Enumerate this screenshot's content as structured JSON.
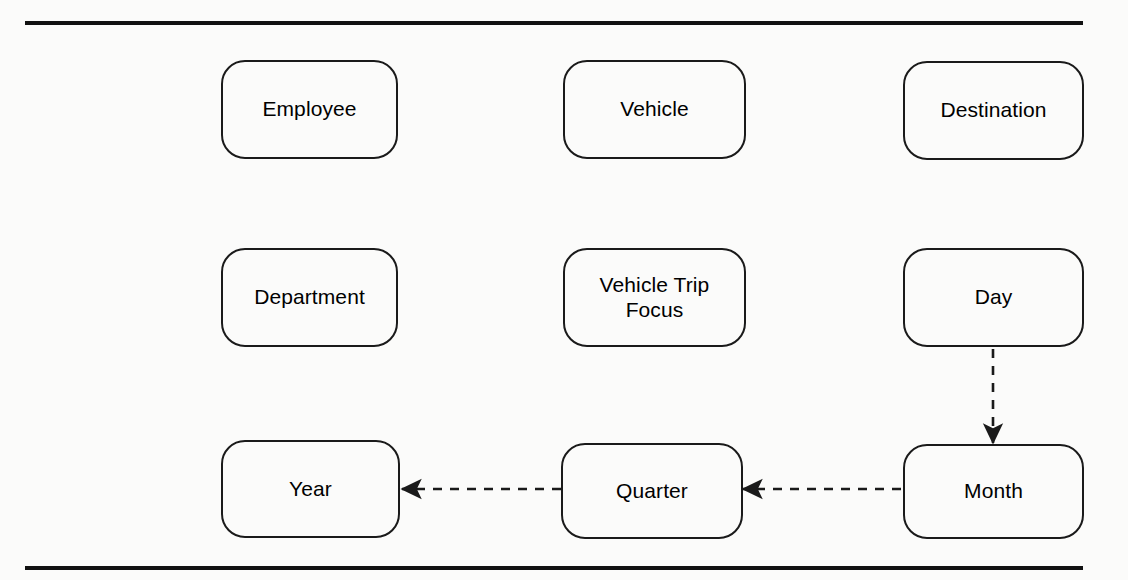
{
  "figure": {
    "kind": "dimensional-model-diagram",
    "background_color": "#fbfbfa",
    "stroke_color": "#1a1a1a",
    "rule_color": "#111111"
  },
  "nodes": {
    "employee": {
      "label": "Employee"
    },
    "vehicle": {
      "label": "Vehicle"
    },
    "destination": {
      "label": "Destination"
    },
    "department": {
      "label": "Department"
    },
    "fact": {
      "label_line1": "Vehicle Trip",
      "label_line2": "Focus"
    },
    "day": {
      "label": "Day"
    },
    "year": {
      "label": "Year"
    },
    "quarter": {
      "label": "Quarter"
    },
    "month": {
      "label": "Month"
    }
  },
  "edges": [
    {
      "name": "day-to-month",
      "from": "Day",
      "to": "Month",
      "style": "dashed",
      "direction": "down"
    },
    {
      "name": "month-to-quarter",
      "from": "Month",
      "to": "Quarter",
      "style": "dashed",
      "direction": "left"
    },
    {
      "name": "quarter-to-year",
      "from": "Quarter",
      "to": "Year",
      "style": "dashed",
      "direction": "left"
    }
  ]
}
